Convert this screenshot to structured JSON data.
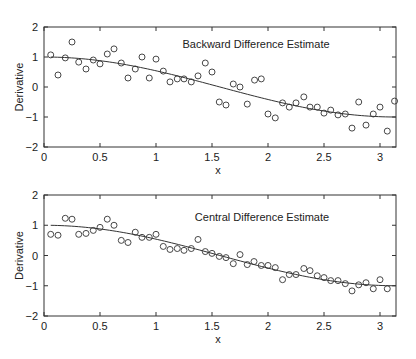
{
  "chart_data": [
    {
      "type": "scatter",
      "title": "",
      "annotation": "Backward Difference Estimate",
      "xlabel": "x",
      "ylabel": "Derivative",
      "xlim": [
        0,
        3.1416
      ],
      "ylim": [
        -2,
        2
      ],
      "xticks": [
        "0",
        "0.5",
        "1",
        "1.5",
        "2",
        "2.5",
        "3"
      ],
      "yticks": [
        "−2",
        "−1",
        "0",
        "1",
        "2"
      ],
      "grid": false,
      "legend": null,
      "series": [
        {
          "name": "Backward difference estimate",
          "style": "open-circle",
          "x": [
            0.06,
            0.125,
            0.19,
            0.25,
            0.31,
            0.375,
            0.44,
            0.5,
            0.565,
            0.625,
            0.69,
            0.75,
            0.815,
            0.875,
            0.94,
            1.0,
            1.065,
            1.125,
            1.19,
            1.25,
            1.315,
            1.375,
            1.44,
            1.5,
            1.565,
            1.625,
            1.69,
            1.75,
            1.815,
            1.88,
            1.94,
            2.0,
            2.065,
            2.13,
            2.19,
            2.25,
            2.32,
            2.375,
            2.44,
            2.5,
            2.56,
            2.625,
            2.69,
            2.75,
            2.81,
            2.875,
            2.94,
            3.0,
            3.065,
            3.13
          ],
          "y": [
            1.07,
            0.4,
            0.97,
            1.5,
            0.83,
            0.6,
            0.9,
            0.77,
            1.1,
            1.27,
            0.8,
            0.3,
            0.6,
            1.0,
            0.3,
            0.93,
            0.53,
            0.17,
            0.27,
            0.27,
            0.17,
            0.37,
            0.8,
            0.5,
            -0.5,
            -0.6,
            0.1,
            0.0,
            -0.57,
            0.23,
            0.27,
            -0.9,
            -1.03,
            -0.53,
            -0.67,
            -0.53,
            -0.33,
            -0.67,
            -0.67,
            -0.87,
            -0.77,
            -0.93,
            -0.9,
            -1.37,
            -0.5,
            -1.27,
            -0.9,
            -0.67,
            -1.47,
            -0.47
          ]
        },
        {
          "name": "Exact derivative cos(x)",
          "style": "line",
          "function": "cos(x)"
        }
      ]
    },
    {
      "type": "scatter",
      "title": "",
      "annotation": "Central Difference Estimate",
      "xlabel": "x",
      "ylabel": "Derivative",
      "xlim": [
        0,
        3.1416
      ],
      "ylim": [
        -2,
        2
      ],
      "xticks": [
        "0",
        "0.5",
        "1",
        "1.5",
        "2",
        "2.5",
        "3"
      ],
      "yticks": [
        "−2",
        "−1",
        "0",
        "1",
        "2"
      ],
      "grid": false,
      "legend": null,
      "series": [
        {
          "name": "Central difference estimate",
          "style": "open-circle",
          "x": [
            0.06,
            0.125,
            0.19,
            0.25,
            0.31,
            0.375,
            0.44,
            0.5,
            0.565,
            0.625,
            0.69,
            0.75,
            0.815,
            0.875,
            0.94,
            1.0,
            1.065,
            1.125,
            1.19,
            1.25,
            1.315,
            1.375,
            1.44,
            1.5,
            1.565,
            1.625,
            1.69,
            1.75,
            1.815,
            1.875,
            1.94,
            2.0,
            2.065,
            2.13,
            2.19,
            2.25,
            2.32,
            2.375,
            2.44,
            2.5,
            2.56,
            2.625,
            2.69,
            2.75,
            2.81,
            2.875,
            2.94,
            3.0,
            3.065
          ],
          "y": [
            0.7,
            0.67,
            1.23,
            1.2,
            0.7,
            0.73,
            0.83,
            0.93,
            1.2,
            1.0,
            0.5,
            0.43,
            0.77,
            0.6,
            0.6,
            0.7,
            0.3,
            0.2,
            0.23,
            0.17,
            0.23,
            0.53,
            0.13,
            0.07,
            -0.03,
            -0.07,
            -0.27,
            0.03,
            -0.3,
            -0.2,
            -0.33,
            -0.33,
            -0.4,
            -0.8,
            -0.63,
            -0.63,
            -0.43,
            -0.5,
            -0.67,
            -0.73,
            -0.83,
            -0.83,
            -0.93,
            -1.17,
            -0.97,
            -0.9,
            -1.1,
            -0.8,
            -1.1
          ]
        },
        {
          "name": "Exact derivative cos(x)",
          "style": "line",
          "function": "cos(x)"
        }
      ]
    }
  ],
  "colors": {
    "axis": "#333333",
    "marker": "#333333",
    "line": "#333333",
    "background": "#ffffff"
  },
  "layout": {
    "panels": [
      {
        "left": 44,
        "top": 27,
        "right": 396,
        "bottom": 147
      },
      {
        "left": 44,
        "top": 195,
        "right": 396,
        "bottom": 316
      }
    ],
    "px_per_x": 112,
    "annotation_pos": [
      [
        256,
        48
      ],
      [
        262,
        221
      ]
    ]
  }
}
